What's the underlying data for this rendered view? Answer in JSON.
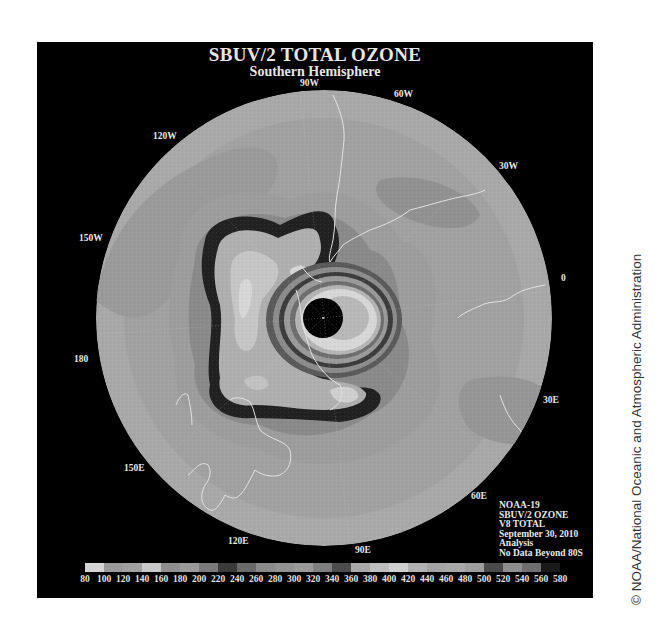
{
  "map": {
    "title": "SBUV/2 TOTAL OZONE",
    "subtitle": "Southern Hemisphere",
    "projection": "south-polar-stereographic",
    "longitude_labels": [
      {
        "text": "90W",
        "x": 300,
        "y": 78
      },
      {
        "text": "60W",
        "x": 394,
        "y": 89
      },
      {
        "text": "120W",
        "x": 153,
        "y": 131
      },
      {
        "text": "30W",
        "x": 499,
        "y": 161
      },
      {
        "text": "150W",
        "x": 79,
        "y": 233
      },
      {
        "text": "0",
        "x": 561,
        "y": 273
      },
      {
        "text": "180",
        "x": 74,
        "y": 354
      },
      {
        "text": "30E",
        "x": 543,
        "y": 395
      },
      {
        "text": "150E",
        "x": 124,
        "y": 463
      },
      {
        "text": "60E",
        "x": 471,
        "y": 491
      },
      {
        "text": "120E",
        "x": 228,
        "y": 536
      },
      {
        "text": "90E",
        "x": 355,
        "y": 545
      }
    ],
    "info_block": [
      "NOAA-19",
      "SBUV/2 OZONE",
      "V8 TOTAL",
      "September 30, 2010",
      "Analysis",
      "No Data Beyond 80S"
    ]
  },
  "colorbar": {
    "units": "Dobson Units",
    "ticks": [
      "80",
      "100",
      "120",
      "140",
      "160",
      "180",
      "200",
      "220",
      "240",
      "260",
      "280",
      "300",
      "320",
      "340",
      "360",
      "380",
      "400",
      "420",
      "440",
      "460",
      "480",
      "500",
      "520",
      "540",
      "560",
      "580"
    ],
    "colors": [
      "#d4d4d4",
      "#9a9a9a",
      "#a0a0a0",
      "#c8c8c8",
      "#8e8e8e",
      "#9a9a9a",
      "#7a7a7a",
      "#3a3a3a",
      "#6a6a6a",
      "#8a8a8a",
      "#929292",
      "#9a9a9a",
      "#7e7e7e",
      "#4c4c4c",
      "#a8a8a8",
      "#bdbdbd",
      "#d0d0d0",
      "#b2b2b2",
      "#a4a4a4",
      "#a8a8a8",
      "#9e9e9e",
      "#4a4a4a",
      "#8e8e8e",
      "#6e6e6e",
      "#1a1a1a"
    ]
  },
  "credit": "© NOAA/National Oceanic and Atmospheric Administration"
}
